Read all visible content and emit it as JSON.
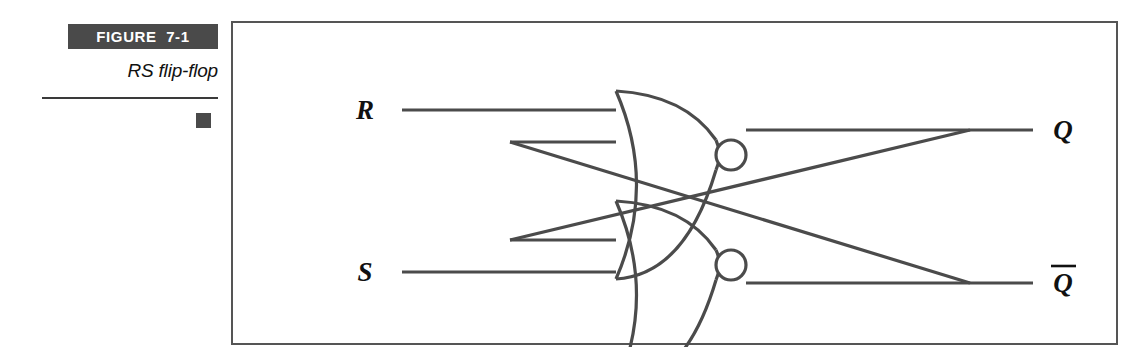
{
  "caption": {
    "figure_number": "FIGURE  7-1",
    "title": "RS flip-flop",
    "band_color": "#4a4a4a",
    "marker_color": "#4a4a4a",
    "rule_color": "#3a3a3a"
  },
  "figure": {
    "border_color": "#555555",
    "background": "#ffffff",
    "wire_color": "#4b4b4b",
    "label_color": "#111111",
    "diagram_type": "logic-circuit",
    "circuit_name": "RS flip-flop",
    "gates": [
      {
        "id": "nor-gate-top",
        "type": "NOR",
        "inputs": [
          "R",
          "Q-bar-feedback"
        ],
        "output": "Q"
      },
      {
        "id": "nor-gate-bottom",
        "type": "NOR",
        "inputs": [
          "S",
          "Q-feedback"
        ],
        "output": "Q-bar"
      }
    ],
    "labels": {
      "input_top": "R",
      "input_bottom": "S",
      "output_top": "Q",
      "output_bottom": "Q",
      "output_bottom_overbar": true
    }
  }
}
